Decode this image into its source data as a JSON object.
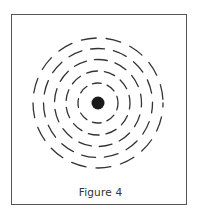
{
  "figure": {
    "caption": "Figure 4",
    "center_dot": {
      "cx": 98,
      "cy": 103,
      "r": 6.5,
      "color": "#1a1a1a"
    },
    "rings": [
      {
        "r": 20,
        "dash": "9 6",
        "offset": 2
      },
      {
        "r": 32,
        "dash": "11 7",
        "offset": 5
      },
      {
        "r": 43.5,
        "dash": "13 8",
        "offset": 9
      },
      {
        "r": 54.5,
        "dash": "14 9",
        "offset": 4
      },
      {
        "r": 65,
        "dash": "15 10",
        "offset": 11
      }
    ],
    "ring_color": "#333333",
    "border_color": "#555555"
  }
}
